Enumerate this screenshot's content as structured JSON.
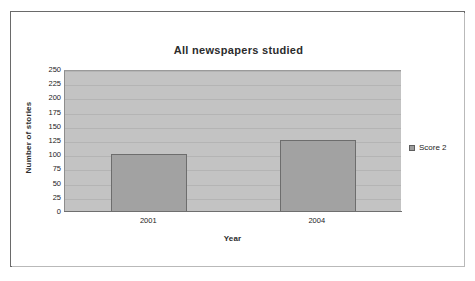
{
  "chart_data": {
    "type": "bar",
    "title": "All newspapers studied",
    "xlabel": "Year",
    "ylabel": "Number of stories",
    "categories": [
      "2001",
      "2004"
    ],
    "series": [
      {
        "name": "Score 2",
        "values": [
          103,
          126
        ]
      }
    ],
    "ylim": [
      0,
      250
    ],
    "ytick_labels": [
      "250",
      "225",
      "200",
      "175",
      "150",
      "125",
      "100",
      "75",
      "50",
      "25",
      "0"
    ],
    "ytick_values": [
      250,
      225,
      200,
      175,
      150,
      125,
      100,
      75,
      50,
      25,
      0
    ],
    "ytick_interval": 25,
    "grid": true,
    "grid_axis": "y",
    "legend": {
      "position": "right",
      "entries": [
        {
          "label": "Score 2",
          "marker": "legend-swatch-icon",
          "color": "#9d9d9d"
        }
      ]
    },
    "colors": {
      "bar_fill": "#a2a2a2",
      "bar_border": "#6d6d6d",
      "plot_background": "#c3c3c3",
      "gridline": "#b4b4b4",
      "text": "#232323",
      "frame_border": "#6a6a6a",
      "page_background": "#ffffff"
    }
  }
}
